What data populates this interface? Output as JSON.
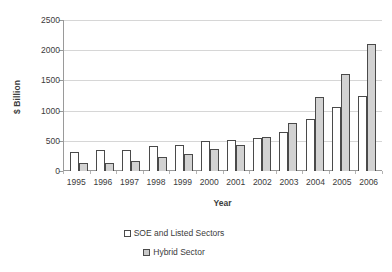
{
  "chart_data": {
    "type": "bar",
    "title": "",
    "subtitle": "",
    "xlabel": "Year",
    "ylabel": "$ Billion",
    "categories": [
      "1995",
      "1996",
      "1997",
      "1998",
      "1999",
      "2000",
      "2001",
      "2002",
      "2003",
      "2004",
      "2005",
      "2006"
    ],
    "series": [
      {
        "name": "SOE and Listed Sectors",
        "color": "#ffffff",
        "values": [
          320,
          340,
          345,
          415,
          435,
          495,
          520,
          545,
          645,
          860,
          1060,
          1245
        ]
      },
      {
        "name": "Hybrid Sector",
        "color": "#d2d2d2",
        "values": [
          130,
          140,
          170,
          240,
          275,
          360,
          435,
          555,
          795,
          1230,
          1610,
          2100
        ]
      }
    ],
    "ylim": [
      0,
      2500
    ],
    "yticks": [
      2500,
      2000,
      1500,
      1000,
      500,
      0
    ],
    "ytick_labels": [
      "2500",
      "2000",
      "1500",
      "1000",
      "500",
      "0"
    ],
    "grid": true,
    "legend_position": "bottom"
  },
  "legend": {
    "entries": [
      {
        "label": "SOE and Listed Sectors"
      },
      {
        "label": "Hybrid Sector"
      }
    ]
  },
  "axes": {
    "x_title": "Year",
    "y_title": "$ Billion"
  }
}
